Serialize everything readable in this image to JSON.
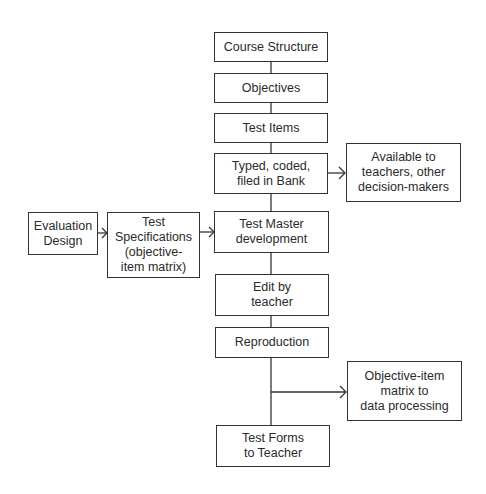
{
  "diagram": {
    "type": "flowchart",
    "nodes": {
      "course_structure": "Course Structure",
      "objectives": "Objectives",
      "test_items": "Test Items",
      "typed_coded": "Typed, coded,\nfiled in Bank",
      "available_to": "Available to\nteachers, other\ndecision-makers",
      "evaluation_design": "Evaluation\nDesign",
      "test_specifications": "Test\nSpecifications\n(objective-\nitem matrix)",
      "test_master": "Test Master\ndevelopment",
      "edit_by_teacher": "Edit by\nteacher",
      "reproduction": "Reproduction",
      "objective_item_matrix": "Objective-item\nmatrix to\ndata processing",
      "test_forms": "Test Forms\nto Teacher"
    },
    "edges": [
      [
        "course_structure",
        "objectives"
      ],
      [
        "objectives",
        "test_items"
      ],
      [
        "test_items",
        "typed_coded"
      ],
      [
        "typed_coded",
        "available_to"
      ],
      [
        "typed_coded",
        "test_master"
      ],
      [
        "evaluation_design",
        "test_specifications"
      ],
      [
        "test_specifications",
        "test_master"
      ],
      [
        "test_master",
        "edit_by_teacher"
      ],
      [
        "edit_by_teacher",
        "reproduction"
      ],
      [
        "reproduction",
        "objective_item_matrix"
      ],
      [
        "reproduction",
        "test_forms"
      ]
    ],
    "colors": {
      "line": "#333333",
      "text": "#2a2a2a",
      "background": "#ffffff"
    }
  }
}
